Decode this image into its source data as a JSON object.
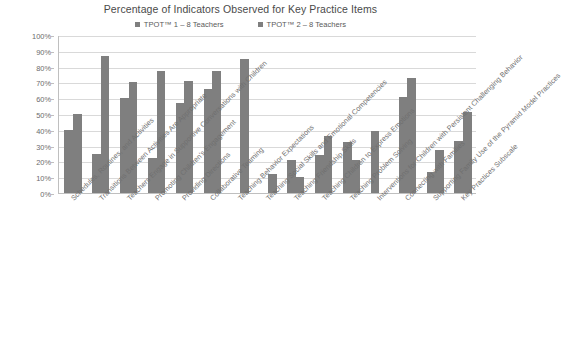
{
  "chart_data": {
    "type": "bar",
    "title": "Percentage of Indicators Observed for Key Practice Items",
    "xlabel": "",
    "ylabel": "",
    "ylim": [
      0,
      100
    ],
    "ytick_labels": [
      "100%",
      "90%",
      "80%",
      "70%",
      "60%",
      "50%",
      "40%",
      "30%",
      "20%",
      "10%",
      "0%"
    ],
    "ytick_values": [
      100,
      90,
      80,
      70,
      60,
      50,
      40,
      30,
      20,
      10,
      0
    ],
    "grid": true,
    "legend_position": "top-center",
    "categories": [
      "Schedules, Routines, and Activities",
      "Transitions Between Activities Are Appropriate",
      "Teachers Engage in Supportive Conversations with Children",
      "Promoting Children's Engagement",
      "Providing Directions",
      "Collaborative Teaming",
      "Teaching Behavior Expectations",
      "Teaching Social Skills and Emotional Competencies",
      "Teaching Friendship Skills",
      "Teaching Children to Express Emotions",
      "Teaching Problem Solving",
      "Interventions for Children with Persistent Challenging Behavior",
      "Connecting with Families",
      "Supporting Family Use of the Pyramid Model Practices",
      "Key Practices Subscale"
    ],
    "series": [
      {
        "name": "TPOT™ 1 – 8 Teachers",
        "color": "#7f7f7f",
        "values": [
          40,
          25,
          60,
          22,
          57,
          66,
          0,
          0,
          21,
          24,
          32,
          39,
          61,
          13,
          33
        ]
      },
      {
        "name": "TPOT™ 2 – 8 Teachers",
        "color": "#7f7f7f",
        "values": [
          50,
          87,
          70,
          77,
          71,
          77,
          85,
          12,
          10,
          36,
          21,
          0,
          73,
          27,
          51
        ]
      }
    ]
  },
  "legend": {
    "items": [
      {
        "label": "TPOT™ 1 – 8 Teachers",
        "color": "#7f7f7f"
      },
      {
        "label": "TPOT™ 2 – 8 Teachers",
        "color": "#7f7f7f"
      }
    ]
  },
  "colors": {
    "bar": "#7f7f7f",
    "gridline": "#d9d9d9",
    "axis": "#bfbfbf",
    "text": "#6f6f6f",
    "title": "#4a4a4a",
    "background": "#ffffff"
  }
}
